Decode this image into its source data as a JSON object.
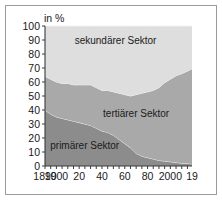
{
  "chart_data": {
    "type": "area",
    "stacked": true,
    "title": "",
    "xlabel": "",
    "ylabel": "in %",
    "ylim": [
      0,
      100
    ],
    "xlim": [
      1890,
      2019
    ],
    "grid": false,
    "legend_position": "inline-band-labels",
    "y_ticks": [
      0,
      10,
      20,
      30,
      40,
      50,
      60,
      70,
      80,
      90,
      100
    ],
    "y_tick_labels": [
      "0",
      "10",
      "20",
      "30",
      "40",
      "50",
      "60",
      "70",
      "80",
      "90",
      "100"
    ],
    "x_ticks": [
      1890,
      1900,
      1920,
      1940,
      1960,
      1980,
      2000,
      2019
    ],
    "x_tick_labels": [
      "1890",
      "1900",
      "20",
      "40",
      "60",
      "80",
      "2000",
      "19"
    ],
    "x_minor_tick_step": 5,
    "x": [
      1890,
      1895,
      1900,
      1905,
      1910,
      1915,
      1920,
      1925,
      1930,
      1935,
      1940,
      1945,
      1950,
      1955,
      1960,
      1965,
      1970,
      1975,
      1980,
      1985,
      1990,
      1995,
      2000,
      2005,
      2010,
      2015,
      2019
    ],
    "series": [
      {
        "name": "primärer Sektor",
        "color": "#8c8c8c",
        "values": [
          40,
          37,
          35,
          34,
          33,
          32,
          31,
          30,
          29,
          27,
          25,
          24,
          22,
          19,
          16,
          13,
          9,
          7,
          6,
          5,
          4,
          3.5,
          3,
          2.5,
          2,
          1.8,
          1.5
        ]
      },
      {
        "name": "tertiärer Sektor",
        "color": "#a9a9a9",
        "values": [
          24,
          25,
          25,
          25,
          26,
          26,
          27,
          28,
          29,
          29,
          29,
          30,
          31,
          33,
          35,
          37,
          42,
          45,
          47,
          49,
          52,
          56,
          59,
          62,
          64,
          66,
          68
        ]
      },
      {
        "name": "sekundärer Sektor",
        "color": "#dedede",
        "values": [
          36,
          38,
          40,
          41,
          41,
          42,
          42,
          42,
          42,
          44,
          46,
          46,
          47,
          48,
          49,
          50,
          49,
          48,
          47,
          46,
          44,
          40.5,
          38,
          35.5,
          34,
          32.2,
          30.5
        ]
      }
    ],
    "band_labels": [
      {
        "text": "sekundärer Sektor",
        "x_frac": 0.48,
        "y_value": 87
      },
      {
        "text": "tertiärer Sektor",
        "x_frac": 0.62,
        "y_value": 35
      },
      {
        "text": "primärer Sektor",
        "x_frac": 0.27,
        "y_value": 12
      }
    ],
    "colors": {
      "primary_sector": "#8c8c8c",
      "tertiary_sector": "#a9a9a9",
      "secondary_sector": "#dedede",
      "axis": "#3a3a3a",
      "frame_border": "#9a9a9a",
      "background": "#ffffff",
      "boundary_line": "#f2f2f2"
    }
  }
}
